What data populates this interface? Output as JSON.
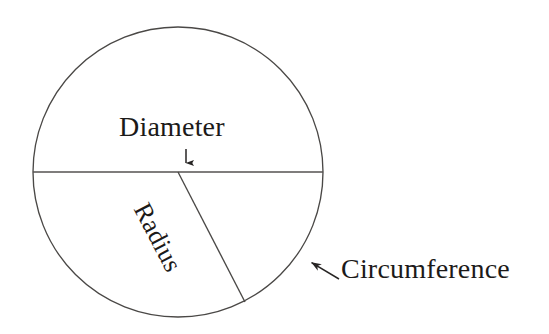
{
  "figure": {
    "background_color": "#ffffff",
    "stroke_color": "#3a3a3a",
    "text_color": "#1c1a19",
    "labels": {
      "diameter": "Diameter",
      "radius": "Radius",
      "circumference": "Circumference"
    },
    "geometry": {
      "circle": {
        "cx": 178,
        "cy": 172,
        "r": 145
      },
      "diameter_line": {
        "x1": 33,
        "y1": 172,
        "x2": 323,
        "y2": 172
      },
      "radius_line": {
        "x1": 178,
        "y1": 172,
        "x2": 245,
        "y2": 302
      },
      "diameter_arrow": {
        "x1": 186,
        "y1": 149,
        "x2": 186,
        "y2": 171
      },
      "circumference_arrow": {
        "x1": 339,
        "y1": 279,
        "x2": 309,
        "y2": 261
      },
      "radius_label_rotation_deg": 62.5
    }
  }
}
